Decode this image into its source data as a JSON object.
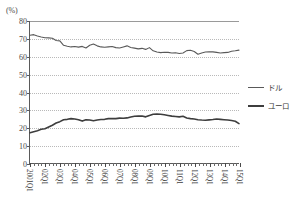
{
  "chart_data": {
    "type": "line",
    "title": "",
    "xlabel": "",
    "ylabel": "",
    "unit_label": "(%)",
    "ylim": [
      0,
      80
    ],
    "yticks": [
      0,
      10,
      20,
      30,
      40,
      50,
      60,
      70,
      80
    ],
    "grid": true,
    "legend_position": "right",
    "x": [
      "2001Q1",
      "2001Q2",
      "2001Q3",
      "2001Q4",
      "2002Q1",
      "2002Q2",
      "2002Q3",
      "2002Q4",
      "2003Q1",
      "2003Q2",
      "2003Q3",
      "2003Q4",
      "2004Q1",
      "2004Q2",
      "2004Q3",
      "2004Q4",
      "2005Q1",
      "2005Q2",
      "2005Q3",
      "2005Q4",
      "2006Q1",
      "2006Q2",
      "2006Q3",
      "2006Q4",
      "2007Q1",
      "2007Q2",
      "2007Q3",
      "2007Q4",
      "2008Q1",
      "2008Q2",
      "2008Q3",
      "2008Q4",
      "2009Q1",
      "2009Q2",
      "2009Q3",
      "2009Q4",
      "2010Q1",
      "2010Q2",
      "2010Q3",
      "2010Q4",
      "2011Q1",
      "2011Q2",
      "2011Q3",
      "2011Q4",
      "2012Q1",
      "2012Q2",
      "2012Q3",
      "2012Q4",
      "2013Q1",
      "2013Q2",
      "2013Q3",
      "2013Q4",
      "2014Q1",
      "2014Q2",
      "2014Q3",
      "2014Q4",
      "2015Q1"
    ],
    "xtick_labels": [
      "2001Q1",
      "02Q1",
      "03Q1",
      "04Q1",
      "05Q1",
      "06Q1",
      "07Q1",
      "08Q1",
      "09Q1",
      "10Q1",
      "11Q1",
      "12Q1",
      "13Q1",
      "14Q1",
      "15Q1"
    ],
    "xtick_label_rotation": 90,
    "series": [
      {
        "name": "ドル",
        "color": "#595959",
        "width": 1.1,
        "values": [
          72.0,
          72.3,
          71.6,
          71.0,
          70.6,
          70.5,
          70.3,
          69.0,
          68.8,
          66.3,
          65.8,
          65.4,
          65.6,
          65.3,
          65.7,
          64.8,
          66.3,
          67.0,
          66.0,
          65.4,
          65.2,
          65.4,
          65.6,
          65.0,
          64.8,
          65.4,
          66.0,
          65.1,
          64.7,
          64.3,
          64.6,
          64.0,
          65.0,
          63.2,
          62.5,
          62.2,
          62.4,
          62.3,
          62.0,
          62.1,
          61.7,
          62.0,
          63.3,
          63.5,
          62.8,
          61.3,
          62.0,
          62.5,
          62.7,
          62.6,
          62.3,
          62.0,
          62.2,
          62.3,
          63.0,
          63.2,
          63.6
        ]
      },
      {
        "name": "ユーロ",
        "color": "#3d3d3d",
        "width": 1.6,
        "values": [
          17.0,
          17.6,
          18.2,
          19.0,
          19.3,
          20.3,
          21.3,
          22.5,
          23.3,
          24.4,
          24.6,
          25.0,
          24.8,
          24.4,
          23.6,
          24.4,
          24.2,
          23.8,
          24.2,
          24.5,
          24.6,
          25.0,
          25.1,
          25.0,
          25.3,
          25.2,
          25.4,
          25.9,
          26.3,
          26.4,
          26.5,
          26.0,
          26.8,
          27.5,
          27.6,
          27.5,
          27.2,
          26.8,
          26.4,
          26.2,
          26.0,
          26.3,
          25.4,
          25.0,
          24.8,
          24.4,
          24.2,
          24.1,
          24.3,
          24.5,
          24.8,
          24.6,
          24.4,
          24.2,
          23.9,
          23.5,
          22.2
        ]
      }
    ]
  },
  "legend": {
    "items": [
      {
        "label": "ドル"
      },
      {
        "label": "ユーロ"
      }
    ]
  }
}
